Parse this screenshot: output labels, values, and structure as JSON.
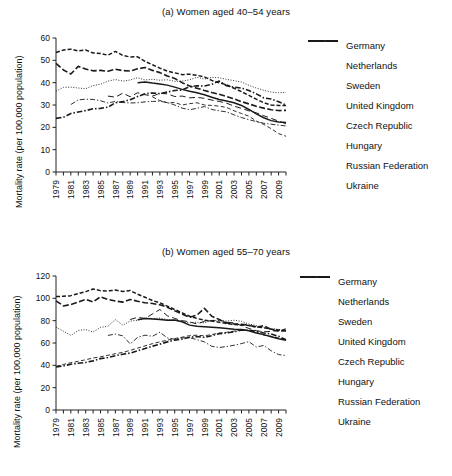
{
  "figure": {
    "ylabel": "Mortality rate (per 100,000 population)",
    "xlabel": ""
  },
  "legend": {
    "entries": [
      {
        "label": "Germany",
        "style": "solid"
      },
      {
        "label": "Netherlands",
        "style": "dashed-short"
      },
      {
        "label": "Sweden",
        "style": "dash-dot-thin"
      },
      {
        "label": "United Kingdom",
        "style": "dashed-bold"
      },
      {
        "label": "Czech Republic",
        "style": "dashed-long-thin"
      },
      {
        "label": "Hungary",
        "style": "dotted"
      },
      {
        "label": "Russian Federation",
        "style": "dash-dot-bold"
      },
      {
        "label": "Ukraine",
        "style": "dashed-thin"
      }
    ]
  },
  "chart_data": [
    {
      "type": "line",
      "title": "(a) Women aged 40–54 years",
      "xlabel": "",
      "ylabel": "Mortality rate (per 100,000 population)",
      "ylim": [
        0,
        60
      ],
      "yticks": [
        0,
        10,
        20,
        30,
        40,
        50,
        60
      ],
      "xlim": [
        1979,
        2010
      ],
      "xticks": [
        1979,
        1981,
        1983,
        1985,
        1987,
        1989,
        1991,
        1993,
        1995,
        1997,
        1999,
        2001,
        2003,
        2005,
        2007,
        2009
      ],
      "x": [
        1979,
        1980,
        1981,
        1982,
        1983,
        1984,
        1985,
        1986,
        1987,
        1988,
        1989,
        1990,
        1991,
        1992,
        1993,
        1994,
        1995,
        1996,
        1997,
        1998,
        1999,
        2000,
        2001,
        2002,
        2003,
        2004,
        2005,
        2006,
        2007,
        2008,
        2009,
        2010
      ],
      "grid": false,
      "legend_position": "right",
      "series": [
        {
          "name": "Germany",
          "style": "solid",
          "values": [
            null,
            null,
            null,
            null,
            null,
            null,
            null,
            null,
            null,
            null,
            null,
            40.0,
            40.3,
            39.8,
            39.4,
            38.9,
            38.0,
            37.0,
            36.2,
            35.5,
            34.6,
            33.5,
            32.5,
            31.8,
            31.0,
            29.8,
            28.0,
            26.0,
            24.3,
            23.0,
            22.4,
            22.2
          ]
        },
        {
          "name": "Netherlands",
          "style": "dashed-short",
          "values": [
            53.5,
            54.6,
            55.0,
            54.2,
            54.6,
            53.3,
            53.1,
            52.3,
            54.0,
            52.2,
            51.5,
            51.6,
            49.5,
            48.0,
            46.5,
            45.2,
            44.4,
            43.6,
            43.8,
            43.3,
            42.6,
            41.0,
            40.0,
            39.0,
            37.5,
            36.0,
            34.3,
            32.6,
            31.0,
            30.0,
            29.8,
            29.8
          ]
        },
        {
          "name": "Sweden",
          "style": "dash-dot-thin",
          "values": [
            null,
            null,
            30.2,
            32.3,
            32.6,
            32.5,
            31.9,
            30.9,
            31.6,
            31.1,
            30.9,
            31.0,
            31.4,
            31.6,
            31.7,
            31.1,
            30.0,
            28.6,
            27.9,
            28.5,
            29.3,
            28.0,
            27.4,
            26.9,
            25.6,
            24.4,
            23.4,
            22.6,
            21.8,
            21.4,
            21.0,
            20.6
          ]
        },
        {
          "name": "United Kingdom",
          "style": "dashed-bold",
          "values": [
            48.6,
            45.7,
            43.9,
            47.3,
            46.1,
            45.3,
            45.5,
            45.1,
            46.0,
            45.4,
            45.2,
            46.2,
            46.8,
            45.5,
            44.5,
            43.0,
            41.9,
            40.0,
            38.5,
            37.5,
            36.5,
            35.6,
            34.8,
            33.8,
            32.7,
            31.5,
            30.5,
            29.4,
            28.6,
            27.9,
            27.5,
            27.6
          ]
        },
        {
          "name": "Czech Republic",
          "style": "dashed-long-thin",
          "values": [
            null,
            null,
            null,
            null,
            null,
            null,
            null,
            34.0,
            33.5,
            35.3,
            33.7,
            35.5,
            34.6,
            34.0,
            35.2,
            35.0,
            33.8,
            34.0,
            33.2,
            33.4,
            33.0,
            32.2,
            31.6,
            30.8,
            29.5,
            28.5,
            27.4,
            26.5,
            25.2,
            24.0,
            22.8,
            21.6
          ]
        },
        {
          "name": "Hungary",
          "style": "dotted",
          "values": [
            36.2,
            37.9,
            38.0,
            37.6,
            37.3,
            38.7,
            39.3,
            40.7,
            41.4,
            40.7,
            41.2,
            42.2,
            41.2,
            41.5,
            41.1,
            41.3,
            40.6,
            40.7,
            41.3,
            42.4,
            41.6,
            42.4,
            42.2,
            41.5,
            40.9,
            40.3,
            38.8,
            37.6,
            36.6,
            35.8,
            35.5,
            35.6
          ]
        },
        {
          "name": "Russian Federation",
          "style": "dash-dot-bold",
          "values": [
            24.0,
            24.5,
            26.2,
            26.9,
            27.5,
            28.3,
            28.5,
            29.0,
            31.0,
            31.5,
            32.4,
            33.8,
            35.0,
            35.4,
            35.1,
            35.8,
            36.5,
            36.7,
            38.2,
            38.6,
            38.5,
            39.3,
            40.7,
            38.6,
            38.0,
            37.6,
            36.5,
            35.0,
            33.2,
            32.7,
            31.5,
            30.0
          ]
        },
        {
          "name": "Ukraine",
          "style": "dashed-thin",
          "values": [
            null,
            null,
            null,
            null,
            null,
            null,
            null,
            null,
            null,
            null,
            null,
            null,
            null,
            33.6,
            32.0,
            31.0,
            31.1,
            30.0,
            30.6,
            31.0,
            30.0,
            29.8,
            29.5,
            28.9,
            27.4,
            26.2,
            25.0,
            22.8,
            21.3,
            19.4,
            17.2,
            16.0
          ]
        }
      ]
    },
    {
      "type": "line",
      "title": "(b) Women aged 55–70 years",
      "xlabel": "",
      "ylabel": "Mortality rate (per 100,000 population)",
      "ylim": [
        0,
        120
      ],
      "yticks": [
        0,
        20,
        40,
        60,
        80,
        100,
        120
      ],
      "xlim": [
        1979,
        2010
      ],
      "xticks": [
        1979,
        1981,
        1983,
        1985,
        1987,
        1989,
        1991,
        1993,
        1995,
        1997,
        1999,
        2001,
        2003,
        2005,
        2007,
        2009
      ],
      "x": [
        1979,
        1980,
        1981,
        1982,
        1983,
        1984,
        1985,
        1986,
        1987,
        1988,
        1989,
        1990,
        1991,
        1992,
        1993,
        1994,
        1995,
        1996,
        1997,
        1998,
        1999,
        2000,
        2001,
        2002,
        2003,
        2004,
        2005,
        2006,
        2007,
        2008,
        2009,
        2010
      ],
      "grid": false,
      "legend_position": "right",
      "series": [
        {
          "name": "Germany",
          "style": "solid",
          "values": [
            null,
            null,
            null,
            null,
            null,
            null,
            null,
            null,
            null,
            null,
            null,
            80.8,
            82.0,
            81.6,
            81.0,
            80.4,
            80.6,
            79.0,
            76.0,
            75.0,
            74.6,
            74.2,
            73.6,
            73.0,
            72.4,
            72.0,
            71.0,
            69.0,
            67.5,
            65.6,
            63.8,
            62.5
          ]
        },
        {
          "name": "Netherlands",
          "style": "dashed-short",
          "values": [
            101.6,
            101.8,
            102.4,
            104.2,
            106.0,
            108.4,
            106.9,
            106.6,
            107.4,
            106.2,
            107.0,
            103.6,
            101.0,
            98.0,
            96.0,
            93.0,
            90.0,
            87.0,
            84.0,
            82.0,
            80.4,
            79.6,
            78.6,
            77.4,
            76.6,
            76.2,
            75.6,
            74.6,
            73.6,
            72.4,
            71.6,
            71.0
          ]
        },
        {
          "name": "Sweden",
          "style": "dash-dot-thin",
          "values": [
            null,
            null,
            null,
            null,
            null,
            null,
            null,
            66.8,
            68.0,
            66.4,
            59.2,
            65.0,
            67.0,
            66.0,
            69.6,
            64.6,
            63.4,
            64.6,
            64.8,
            63.0,
            61.0,
            57.0,
            56.0,
            56.8,
            58.0,
            59.5,
            61.2,
            56.4,
            57.8,
            53.0,
            49.6,
            48.8
          ]
        },
        {
          "name": "United Kingdom",
          "style": "dashed-bold",
          "values": [
            97.8,
            93.2,
            94.5,
            96.6,
            99.2,
            96.8,
            101.4,
            99.0,
            97.6,
            96.6,
            99.0,
            97.4,
            96.0,
            95.4,
            94.2,
            92.0,
            88.8,
            86.0,
            83.0,
            85.0,
            91.0,
            84.0,
            81.0,
            78.0,
            77.0,
            76.8,
            76.0,
            74.0,
            75.6,
            72.0,
            70.6,
            71.0
          ]
        },
        {
          "name": "Czech Republic",
          "style": "dashed-long-thin",
          "values": [
            null,
            null,
            null,
            null,
            null,
            null,
            null,
            null,
            null,
            null,
            81.0,
            83.0,
            82.0,
            86.0,
            90.0,
            84.4,
            82.0,
            80.0,
            79.0,
            77.0,
            79.4,
            80.0,
            80.6,
            78.6,
            78.0,
            75.6,
            73.0,
            71.0,
            70.0,
            70.4,
            71.4,
            72.6
          ]
        },
        {
          "name": "Hungary",
          "style": "dotted",
          "values": [
            74.2,
            70.6,
            66.8,
            71.2,
            72.0,
            69.8,
            74.0,
            75.0,
            81.0,
            76.0,
            79.6,
            80.4,
            82.4,
            82.0,
            82.2,
            81.0,
            80.2,
            79.4,
            78.0,
            78.6,
            78.0,
            80.4,
            80.0,
            79.6,
            80.4,
            79.4,
            77.0,
            75.6,
            74.0,
            73.0,
            72.2,
            71.6
          ]
        },
        {
          "name": "Russian Federation",
          "style": "dash-dot-bold",
          "values": [
            38.6,
            39.5,
            41.0,
            41.8,
            42.6,
            44.0,
            46.0,
            47.0,
            48.6,
            50.0,
            51.0,
            53.0,
            55.0,
            57.2,
            59.0,
            61.0,
            62.6,
            63.5,
            65.2,
            65.8,
            65.0,
            66.6,
            68.4,
            69.0,
            70.0,
            71.6,
            71.4,
            70.6,
            69.0,
            68.0,
            66.0,
            63.0
          ]
        },
        {
          "name": "Ukraine",
          "style": "dashed-thin",
          "values": [
            39.0,
            40.8,
            42.4,
            43.6,
            45.0,
            46.6,
            47.6,
            49.0,
            50.4,
            51.6,
            53.4,
            55.4,
            57.4,
            59.4,
            61.0,
            62.6,
            64.0,
            65.2,
            66.6,
            67.0,
            66.4,
            67.6,
            68.8,
            69.6,
            70.6,
            71.8,
            71.0,
            69.6,
            67.0,
            66.0,
            64.6,
            62.6
          ]
        }
      ]
    }
  ]
}
